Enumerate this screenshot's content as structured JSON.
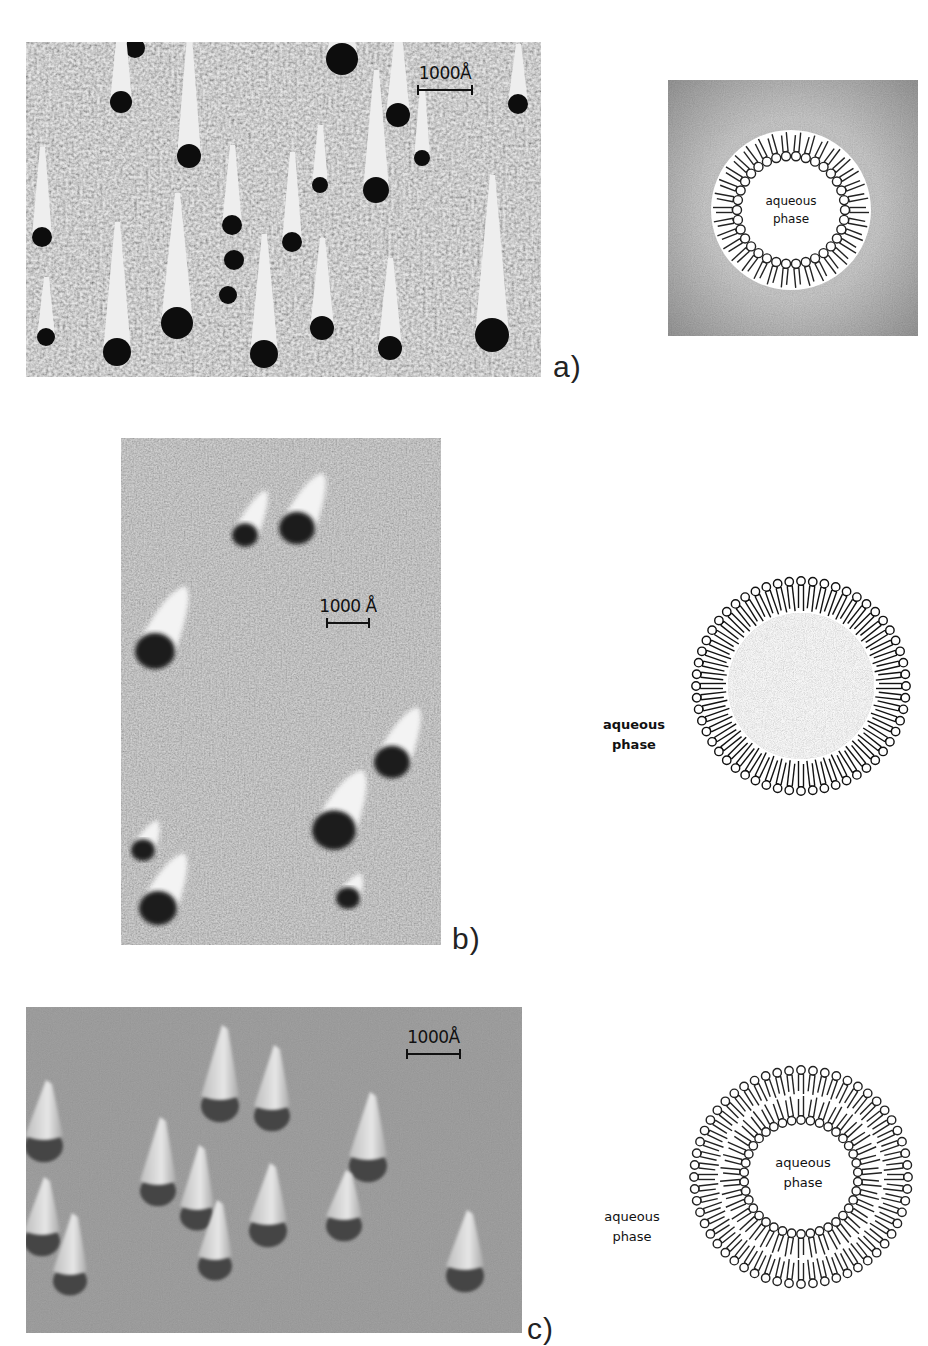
{
  "figure": {
    "panels": [
      {
        "id": "a",
        "label": "a)",
        "micrograph": {
          "x": 26,
          "y": 42,
          "w": 515,
          "h": 335,
          "background": "#9a9a9a",
          "texture": "coarse",
          "scale_label": "1000Å",
          "shadows": [
            {
              "cx": 135,
              "cy": 48,
              "r": 10,
              "len": 60
            },
            {
              "cx": 189,
              "cy": 156,
              "r": 12,
              "len": 120
            },
            {
              "cx": 121,
              "cy": 102,
              "r": 11,
              "len": 90
            },
            {
              "cx": 342,
              "cy": 59,
              "r": 16,
              "len": 80
            },
            {
              "cx": 398,
              "cy": 115,
              "r": 12,
              "len": 90
            },
            {
              "cx": 376,
              "cy": 190,
              "r": 13,
              "len": 120
            },
            {
              "cx": 422,
              "cy": 158,
              "r": 8,
              "len": 70
            },
            {
              "cx": 320,
              "cy": 185,
              "r": 8,
              "len": 60
            },
            {
              "cx": 518,
              "cy": 104,
              "r": 10,
              "len": 60
            },
            {
              "cx": 42,
              "cy": 237,
              "r": 10,
              "len": 90
            },
            {
              "cx": 232,
              "cy": 225,
              "r": 10,
              "len": 80
            },
            {
              "cx": 234,
              "cy": 260,
              "r": 10,
              "len": 0
            },
            {
              "cx": 228,
              "cy": 295,
              "r": 9,
              "len": 0
            },
            {
              "cx": 292,
              "cy": 242,
              "r": 10,
              "len": 90
            },
            {
              "cx": 46,
              "cy": 337,
              "r": 9,
              "len": 60
            },
            {
              "cx": 117,
              "cy": 352,
              "r": 14,
              "len": 130
            },
            {
              "cx": 177,
              "cy": 323,
              "r": 16,
              "len": 130
            },
            {
              "cx": 264,
              "cy": 354,
              "r": 14,
              "len": 120
            },
            {
              "cx": 322,
              "cy": 328,
              "r": 12,
              "len": 90
            },
            {
              "cx": 390,
              "cy": 348,
              "r": 12,
              "len": 90
            },
            {
              "cx": 492,
              "cy": 335,
              "r": 17,
              "len": 160
            }
          ]
        },
        "scale_pos": {
          "x": 414,
          "y": 64,
          "bar_w": 56
        },
        "label_pos": {
          "x": 553,
          "y": 350
        },
        "schematic": {
          "type": "unilamellar-vesicle-in-medium",
          "x": 668,
          "y": 80,
          "w": 250,
          "h": 256,
          "inner_label": [
            "aqueous",
            "phase"
          ],
          "outer_label": null
        }
      },
      {
        "id": "b",
        "label": "b)",
        "micrograph": {
          "x": 121,
          "y": 438,
          "w": 320,
          "h": 507,
          "background": "#a4a4a4",
          "texture": "fine",
          "scale_label": "1000Å",
          "shadows": [
            {
              "cx": 245,
              "cy": 535,
              "r": 13,
              "len": 45
            },
            {
              "cx": 297,
              "cy": 528,
              "r": 18,
              "len": 55
            },
            {
              "cx": 155,
              "cy": 651,
              "r": 20,
              "len": 65
            },
            {
              "cx": 392,
              "cy": 762,
              "r": 18,
              "len": 55
            },
            {
              "cx": 334,
              "cy": 830,
              "r": 22,
              "len": 60
            },
            {
              "cx": 143,
              "cy": 850,
              "r": 12,
              "len": 30
            },
            {
              "cx": 158,
              "cy": 908,
              "r": 19,
              "len": 55
            },
            {
              "cx": 348,
              "cy": 898,
              "r": 12,
              "len": 25
            }
          ]
        },
        "scale_label_text": "1000 Å",
        "scale_pos": {
          "x": 316,
          "y": 597,
          "bar_w": 44
        },
        "label_pos": {
          "x": 452,
          "y": 922
        },
        "schematic": {
          "type": "reversed-micelle",
          "x": 690,
          "y": 575,
          "w": 222,
          "h": 222,
          "inner_label": null,
          "outer_label": [
            "aqueous",
            "phase"
          ],
          "outer_label_pos": {
            "x": 598,
            "y": 715
          }
        }
      },
      {
        "id": "c",
        "label": "c)",
        "micrograph": {
          "x": 26,
          "y": 1007,
          "w": 496,
          "h": 326,
          "background": "#8e8e8e",
          "texture": "smooth",
          "scale_label": "1000Å",
          "cones": [
            {
              "cx": 220,
              "cy": 1100,
              "w": 38,
              "h": 75
            },
            {
              "cx": 272,
              "cy": 1110,
              "w": 36,
              "h": 65
            },
            {
              "cx": 44,
              "cy": 1140,
              "w": 38,
              "h": 60
            },
            {
              "cx": 158,
              "cy": 1185,
              "w": 36,
              "h": 68
            },
            {
              "cx": 197,
              "cy": 1210,
              "w": 34,
              "h": 65
            },
            {
              "cx": 268,
              "cy": 1225,
              "w": 38,
              "h": 62
            },
            {
              "cx": 368,
              "cy": 1160,
              "w": 38,
              "h": 68
            },
            {
              "cx": 344,
              "cy": 1220,
              "w": 36,
              "h": 50
            },
            {
              "cx": 42,
              "cy": 1235,
              "w": 36,
              "h": 58
            },
            {
              "cx": 70,
              "cy": 1275,
              "w": 34,
              "h": 62
            },
            {
              "cx": 215,
              "cy": 1260,
              "w": 34,
              "h": 60
            },
            {
              "cx": 465,
              "cy": 1270,
              "w": 38,
              "h": 60
            }
          ]
        },
        "scale_pos": {
          "x": 403,
          "y": 1028,
          "bar_w": 55
        },
        "label_pos": {
          "x": 527,
          "y": 1312
        },
        "schematic": {
          "type": "bilayer-vesicle",
          "x": 688,
          "y": 1064,
          "w": 226,
          "h": 226,
          "inner_label": [
            "aqueous",
            "phase"
          ],
          "outer_label": [
            "aqueous",
            "phase"
          ],
          "outer_label_pos": {
            "x": 596,
            "y": 1207
          }
        }
      }
    ]
  }
}
